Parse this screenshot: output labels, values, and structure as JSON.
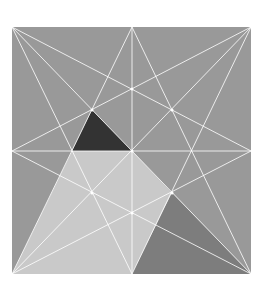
{
  "figure": {
    "square": {
      "x1": 12,
      "y1": 27,
      "x2": 251,
      "y2": 274
    },
    "colors": {
      "background": "#999999",
      "light_region": "#c9c9c9",
      "dark_triangle": "#333333",
      "medium_triangle": "#7d7d7d",
      "lines": "#ffffff",
      "page": "#ffffff"
    },
    "regions": [
      {
        "name": "light-region",
        "fill": "#c9c9c9",
        "points": [
          [
            72,
            151
          ],
          [
            132,
            151
          ],
          [
            172,
            193
          ],
          [
            132,
            274
          ],
          [
            12,
            274
          ]
        ]
      },
      {
        "name": "dark-triangle",
        "fill": "#333333",
        "points": [
          [
            92,
            110
          ],
          [
            72,
            151
          ],
          [
            132,
            151
          ]
        ]
      },
      {
        "name": "medium-triangle",
        "fill": "#7d7d7d",
        "points": [
          [
            172,
            193
          ],
          [
            132,
            274
          ],
          [
            251,
            274
          ]
        ]
      }
    ],
    "lines": [
      [
        12,
        27,
        132,
        274
      ],
      [
        12,
        27,
        251,
        151
      ],
      [
        251,
        27,
        132,
        274
      ],
      [
        251,
        27,
        12,
        151
      ],
      [
        12,
        274,
        132,
        27
      ],
      [
        12,
        274,
        251,
        151
      ],
      [
        251,
        274,
        132,
        27
      ],
      [
        251,
        274,
        12,
        151
      ],
      [
        132,
        27,
        132,
        274
      ],
      [
        12,
        151,
        251,
        151
      ],
      [
        12,
        27,
        251,
        274
      ],
      [
        251,
        27,
        12,
        274
      ]
    ],
    "points": [
      [
        132,
        151
      ],
      [
        132,
        213
      ],
      [
        92,
        193
      ],
      [
        92,
        110
      ],
      [
        172,
        193
      ],
      [
        132,
        89
      ],
      [
        172,
        110
      ]
    ]
  }
}
